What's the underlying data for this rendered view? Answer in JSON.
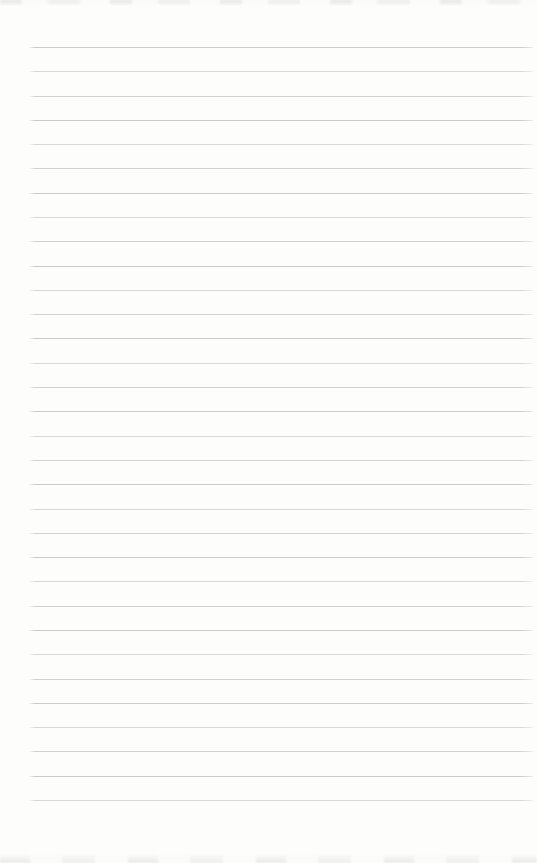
{
  "page": {
    "text_content": "",
    "colors": {
      "background": "#fdfdfc",
      "rule_line": "#c7c9c8",
      "edge_artifact": "#dcdcdc"
    },
    "ruled_lines": {
      "count": 32
    }
  }
}
